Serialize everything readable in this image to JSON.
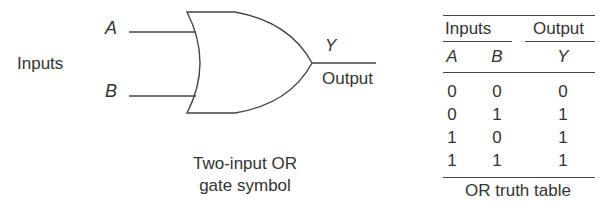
{
  "diagram": {
    "inputs_label": "Inputs",
    "input_a_label": "A",
    "input_b_label": "B",
    "output_var_label": "Y",
    "output_label": "Output",
    "caption_line1": "Two-input OR",
    "caption_line2": "gate symbol",
    "gate_type": "OR",
    "stroke_color": "#444444",
    "text_color": "#333333"
  },
  "truth_table": {
    "group_headers": {
      "inputs": "Inputs",
      "output": "Output"
    },
    "column_headers": [
      "A",
      "B",
      "Y"
    ],
    "rows": [
      [
        "0",
        "0",
        "0"
      ],
      [
        "0",
        "1",
        "1"
      ],
      [
        "1",
        "0",
        "1"
      ],
      [
        "1",
        "1",
        "1"
      ]
    ],
    "caption": "OR truth table"
  }
}
